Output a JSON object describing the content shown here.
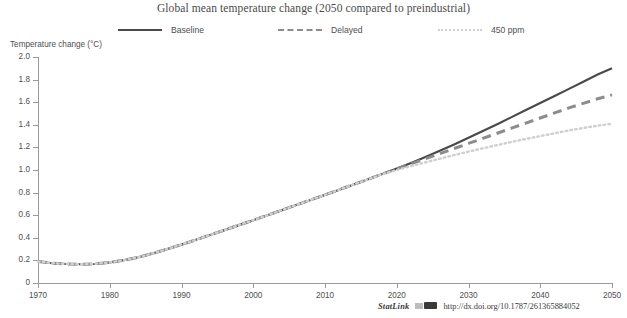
{
  "chart_data": {
    "type": "line",
    "title": "Global mean temperature change (2050 compared to preindustrial)",
    "xlabel": "",
    "ylabel": "Temperature change (°C)",
    "xlim": [
      1970,
      2050
    ],
    "ylim": [
      0,
      2.0
    ],
    "grid": false,
    "legend_position": "top",
    "xticks": [
      "1970",
      "1980",
      "1990",
      "2000",
      "2010",
      "2020",
      "2030",
      "2040",
      "2050"
    ],
    "xtick_values": [
      1970,
      1980,
      1990,
      2000,
      2010,
      2020,
      2030,
      2040,
      2050
    ],
    "yticks": [
      "0",
      "0.2",
      "0.4",
      "0.6",
      "0.8",
      "1.0",
      "1.2",
      "1.4",
      "1.6",
      "1.8",
      "2.0"
    ],
    "ytick_values": [
      0,
      0.2,
      0.4,
      0.6,
      0.8,
      1.0,
      1.2,
      1.4,
      1.6,
      1.8,
      2.0
    ],
    "x": [
      1970,
      1972,
      1974,
      1976,
      1978,
      1980,
      1982,
      1984,
      1986,
      1988,
      1990,
      1992,
      1994,
      1996,
      1998,
      2000,
      2002,
      2004,
      2006,
      2008,
      2010,
      2012,
      2014,
      2016,
      2018,
      2020,
      2022,
      2024,
      2026,
      2028,
      2030,
      2032,
      2034,
      2036,
      2038,
      2040,
      2042,
      2044,
      2046,
      2048,
      2050
    ],
    "series": [
      {
        "name": "Baseline",
        "style": "solid",
        "color": "#4a4a4a",
        "values": [
          0.19,
          0.175,
          0.168,
          0.166,
          0.17,
          0.182,
          0.202,
          0.228,
          0.262,
          0.3,
          0.34,
          0.382,
          0.425,
          0.468,
          0.512,
          0.556,
          0.6,
          0.645,
          0.69,
          0.735,
          0.78,
          0.826,
          0.872,
          0.918,
          0.965,
          1.012,
          1.062,
          1.115,
          1.17,
          1.226,
          1.285,
          1.345,
          1.405,
          1.468,
          1.53,
          1.593,
          1.655,
          1.718,
          1.78,
          1.845,
          1.9
        ]
      },
      {
        "name": "Delayed",
        "style": "dashed",
        "color": "#8c8c8c",
        "values": [
          0.19,
          0.175,
          0.168,
          0.166,
          0.17,
          0.182,
          0.202,
          0.228,
          0.262,
          0.3,
          0.34,
          0.382,
          0.425,
          0.468,
          0.512,
          0.556,
          0.6,
          0.645,
          0.69,
          0.735,
          0.78,
          0.826,
          0.872,
          0.918,
          0.965,
          1.01,
          1.055,
          1.1,
          1.145,
          1.19,
          1.235,
          1.28,
          1.325,
          1.37,
          1.415,
          1.46,
          1.505,
          1.55,
          1.59,
          1.63,
          1.665
        ]
      },
      {
        "name": "450 ppm",
        "style": "dotted",
        "color": "#cfcfcf",
        "values": [
          0.19,
          0.175,
          0.168,
          0.166,
          0.17,
          0.182,
          0.202,
          0.228,
          0.262,
          0.3,
          0.34,
          0.382,
          0.425,
          0.468,
          0.512,
          0.556,
          0.6,
          0.645,
          0.69,
          0.735,
          0.78,
          0.826,
          0.872,
          0.918,
          0.962,
          1.0,
          1.035,
          1.068,
          1.1,
          1.132,
          1.163,
          1.192,
          1.22,
          1.248,
          1.275,
          1.3,
          1.325,
          1.35,
          1.372,
          1.392,
          1.41
        ]
      }
    ]
  },
  "footer": {
    "statlink_label": "StatLink",
    "url": "http://dx.doi.org/10.1787/261365884052"
  }
}
